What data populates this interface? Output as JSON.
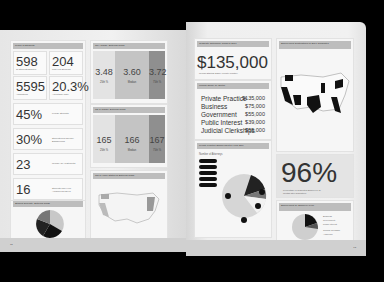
{
  "left_page": {
    "class_profile": {
      "header": "Profile of Students",
      "stats": [
        {
          "value": "598",
          "label": "1L Students Enrolled"
        },
        {
          "value": "204",
          "label": "First Year Students"
        },
        {
          "value": "5595",
          "label": "Applications"
        },
        {
          "value": "20.3%",
          "label": "Acceptance Rate"
        },
        {
          "value": "45%",
          "label": "Female Students"
        },
        {
          "value": "30%",
          "label": "Students from Diverse Backgrounds"
        },
        {
          "value": "23",
          "label": "Median Age of Students"
        },
        {
          "value": "16",
          "label": "Students Who Hold Advanced Degrees"
        }
      ]
    },
    "gpa": {
      "header": "GPA Range, Entering Class",
      "columns": [
        {
          "value": "3.48",
          "label": "25th %"
        },
        {
          "value": "3.60",
          "label": "Median"
        },
        {
          "value": "3.72",
          "label": "75th %"
        }
      ]
    },
    "lsat": {
      "header": "LSAT Range, Entering Class",
      "columns": [
        {
          "value": "165",
          "label": "25th %"
        },
        {
          "value": "166",
          "label": "Median"
        },
        {
          "value": "167",
          "label": "75th %"
        }
      ]
    },
    "undergrad_majors": {
      "header": "Student Diversity, Entering Class",
      "chart_type": "pie"
    },
    "home_states": {
      "header": "Top 5 Home States of Entering Class",
      "labels": [
        "Washington",
        "Oregon",
        "New Jersey",
        "New York",
        "California",
        "Pennsylvania"
      ]
    },
    "footnote": "Data as of Fall Entering Class",
    "page_number": "12"
  },
  "right_page": {
    "median_salary": {
      "header": "Graduate Outcomes: Class of 2017",
      "value": "$135,000",
      "label": "Median Starting Salary: Private Practice"
    },
    "salary_by_sector": {
      "header": "Median Salary by Sector",
      "rows": [
        {
          "sector": "Private Practice",
          "salary": "$135,000"
        },
        {
          "sector": "Business",
          "salary": "$75,000"
        },
        {
          "sector": "Government",
          "salary": "$55,000"
        },
        {
          "sector": "Public Interest",
          "salary": "$39,000"
        },
        {
          "sector": "Judicial Clerkships",
          "salary": "$55,000"
        }
      ]
    },
    "employment_map": {
      "header": "Employment Destinations of 2017 Graduates",
      "labels": [
        "Washington",
        "Illinois",
        "Massachusetts",
        "New York",
        "California",
        "Arizona",
        "Texas",
        "Georgia",
        "Florida",
        "Washington, D.C."
      ]
    },
    "private_practice": {
      "header": "Private Practice Employment by Firm Size",
      "subtitle": "Number of Attorneys",
      "chart_type": "pie"
    },
    "employment_rate": {
      "value": "96%",
      "label": "Percentage of Graduates Employed 10 months after graduation"
    },
    "employment_type": {
      "header": "Employment by Employer Type",
      "chart_type": "pie",
      "legend": [
        "Business",
        "Government",
        "Public Interest",
        "Judicial Clerkship",
        "Academic"
      ]
    },
    "page_number": "13"
  },
  "colors": {
    "background": "#000000",
    "page": "#efefef",
    "header_bar": "#bdbdbd",
    "dark": "#111111"
  }
}
